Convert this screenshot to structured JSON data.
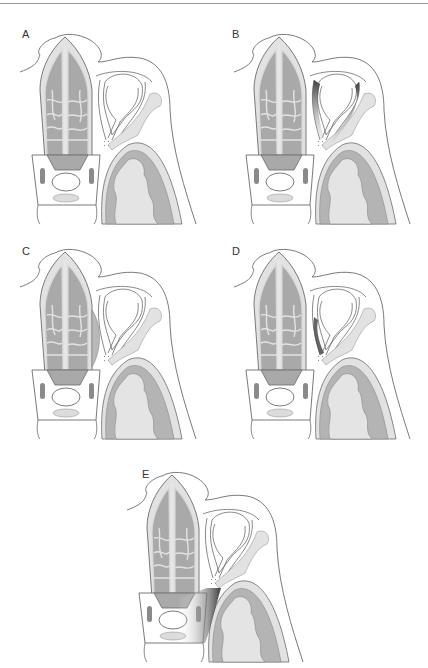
{
  "figure": {
    "type": "anatomical-diagram",
    "colors": {
      "outline": "#6b6b6b",
      "sinus_dark": "#a9a9a9",
      "sinus_mid": "#c6c6c6",
      "bone_light": "#e2e2e2",
      "brain_gray": "#b4b4b4",
      "brain_white": "#e4e4e4",
      "pathology": "#4a4a4a"
    },
    "panels": [
      {
        "id": "A",
        "label": "A",
        "pathology": "none"
      },
      {
        "id": "B",
        "label": "B",
        "pathology": "dark shading along medial and lateral orbital walls"
      },
      {
        "id": "C",
        "label": "C",
        "pathology": "ethmoid bulging into medial orbit"
      },
      {
        "id": "D",
        "label": "D",
        "pathology": "dark shading along medial orbital wall"
      },
      {
        "id": "E",
        "label": "E",
        "pathology": "dark shading in sphenoid / posterior region"
      }
    ]
  }
}
